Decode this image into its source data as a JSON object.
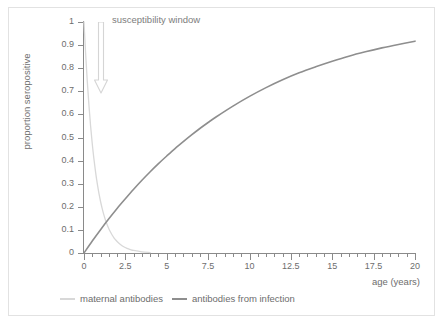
{
  "chart_data": {
    "type": "line",
    "title": "",
    "xlabel": "age (years)",
    "ylabel": "proportion seropositive",
    "xlim": [
      0,
      20
    ],
    "ylim": [
      0,
      1
    ],
    "grid": false,
    "legend_position": "bottom-left",
    "x_ticks": [
      0,
      2.5,
      5,
      7.5,
      10,
      12.5,
      15,
      17.5,
      20
    ],
    "x_tick_labels": [
      "0",
      "2.5",
      "5",
      "7.5",
      "10",
      "12.5",
      "15",
      "17.5",
      "20"
    ],
    "x_minor_tick_step": 0.5,
    "y_ticks": [
      0,
      0.1,
      0.2,
      0.3,
      0.4,
      0.5,
      0.6,
      0.7,
      0.8,
      0.9,
      1
    ],
    "y_tick_labels": [
      "0",
      "0.1",
      "0.2",
      "0.3",
      "0.4",
      "0.5",
      "0.6",
      "0.7",
      "0.8",
      "0.9",
      "1"
    ],
    "series": [
      {
        "name": "maternal antibodies",
        "color": "#d8d8d8",
        "x": [
          0,
          0.1,
          0.2,
          0.3,
          0.4,
          0.5,
          0.6,
          0.7,
          0.8,
          0.9,
          1.0,
          1.1,
          1.2,
          1.3,
          1.4,
          1.5,
          1.6,
          1.7,
          1.8,
          1.9,
          2.0,
          2.2,
          2.4,
          2.6,
          2.8,
          3.0,
          3.5,
          4.0
        ],
        "values": [
          1.0,
          0.861,
          0.741,
          0.638,
          0.549,
          0.472,
          0.407,
          0.35,
          0.301,
          0.259,
          0.223,
          0.192,
          0.165,
          0.142,
          0.122,
          0.105,
          0.091,
          0.078,
          0.067,
          0.058,
          0.05,
          0.037,
          0.027,
          0.02,
          0.015,
          0.011,
          0.005,
          0.002
        ]
      },
      {
        "name": "antibodies from infection",
        "color": "#8e8e8e",
        "x": [
          0,
          0.5,
          1.0,
          1.5,
          2.0,
          2.5,
          3.0,
          3.5,
          4.0,
          4.5,
          5.0,
          5.5,
          6.0,
          6.5,
          7.0,
          7.5,
          8.0,
          9.0,
          10.0,
          11.0,
          12.0,
          13.0,
          14.0,
          15.0,
          16.0,
          17.0,
          18.0,
          19.0,
          20.0
        ],
        "values": [
          0.0,
          0.052,
          0.101,
          0.148,
          0.193,
          0.235,
          0.276,
          0.315,
          0.352,
          0.387,
          0.42,
          0.452,
          0.482,
          0.511,
          0.539,
          0.565,
          0.59,
          0.636,
          0.678,
          0.716,
          0.75,
          0.78,
          0.806,
          0.83,
          0.852,
          0.871,
          0.888,
          0.903,
          0.917
        ]
      }
    ],
    "annotations": [
      {
        "text": "susceptibility window",
        "arrow": "down-arrow",
        "color": "#d0d0d0"
      }
    ]
  },
  "legend": {
    "items": [
      {
        "label": "maternal antibodies",
        "color": "#d8d8d8"
      },
      {
        "label": "antibodies from infection",
        "color": "#8e8e8e"
      }
    ]
  }
}
